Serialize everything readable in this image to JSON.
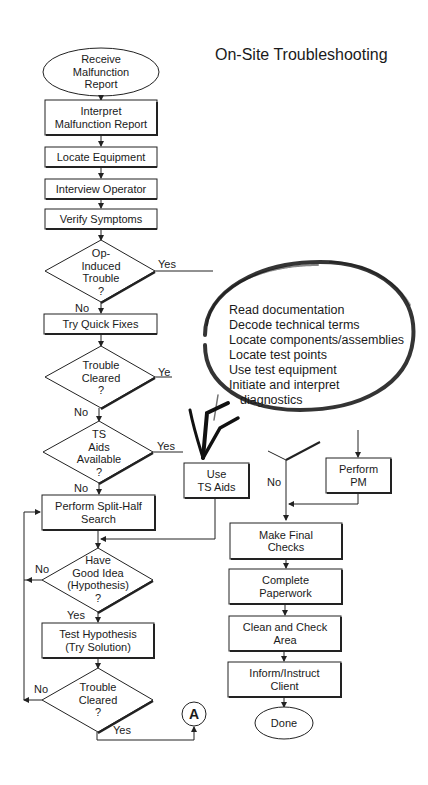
{
  "title": "On-Site Troubleshooting",
  "left_column": {
    "start": "Receive Malfunction Report",
    "interpret": "Interpret Malfunction Report",
    "locate": "Locate Equipment",
    "interview": "Interview Operator",
    "verify": "Verify Symptoms",
    "op_induced": {
      "l1": "Op-",
      "l2": "Induced",
      "l3": "Trouble",
      "l4": "?"
    },
    "quick_fixes": "Try Quick Fixes",
    "cleared1": {
      "l1": "Trouble",
      "l2": "Cleared",
      "l3": "?"
    },
    "ts_aids_q": {
      "l1": "TS",
      "l2": "Aids",
      "l3": "Available",
      "l4": "?"
    },
    "use_ts_aids": {
      "l1": "Use",
      "l2": "TS Aids"
    },
    "split_half": {
      "l1": "Perform Split-Half",
      "l2": "Search"
    },
    "good_idea": {
      "l1": "Have",
      "l2": "Good Idea",
      "l3": "(Hypothesis)",
      "l4": "?"
    },
    "test_hyp": {
      "l1": "Test Hypothesis",
      "l2": "(Try Solution)"
    },
    "cleared2": {
      "l1": "Trouble",
      "l2": "Cleared",
      "l3": "?"
    },
    "connector": "A"
  },
  "right_column": {
    "perform_pm": {
      "l1": "Perform",
      "l2": "PM"
    },
    "final_checks": {
      "l1": "Make Final",
      "l2": "Checks"
    },
    "paperwork": {
      "l1": "Complete",
      "l2": "Paperwork"
    },
    "clean": {
      "l1": "Clean and Check",
      "l2": "Area"
    },
    "inform": {
      "l1": "Inform/Instruct",
      "l2": "Client"
    },
    "done": "Done"
  },
  "labels": {
    "yes": "Yes",
    "ye": "Ye",
    "no": "No"
  },
  "bubble": {
    "items": [
      "Read documentation",
      "Decode technical terms",
      "Locate components/assemblies",
      "Locate test points",
      "Use test equipment",
      "Initiate and interpret",
      "diagnostics"
    ]
  }
}
